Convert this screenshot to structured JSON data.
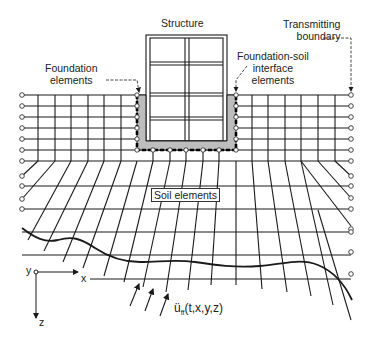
{
  "labels": {
    "structure": "Structure",
    "transmitting_boundary_1": "Transmitting",
    "transmitting_boundary_2": "boundary",
    "foundation_1": "Foundation",
    "foundation_2": "elements",
    "interface_1": "Foundation-soil",
    "interface_2": "interface",
    "interface_3": "elements",
    "soil": "Soil elements"
  },
  "axes": {
    "x": "x",
    "y": "y",
    "z": "z"
  },
  "excitation": {
    "base": "ü",
    "sub": "ff",
    "args": "(t,x,y,z)"
  },
  "colors": {
    "line": "#1a1a1a",
    "foundation_fill": "#bdbdbd",
    "background": "#ffffff"
  }
}
